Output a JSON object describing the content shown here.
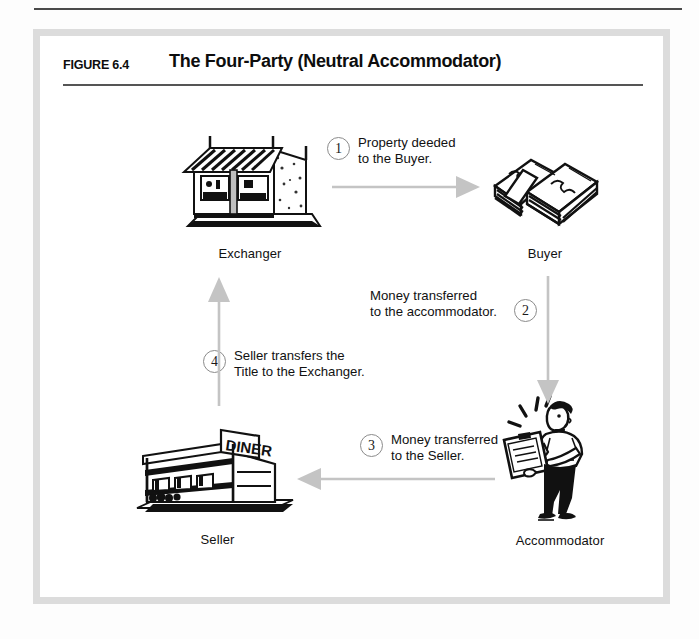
{
  "figure": {
    "number_label": "FIGURE 6.4",
    "title": "The Four-Party (Neutral Accommodator)"
  },
  "colors": {
    "arrow": "#c4c4c4",
    "frame": "#dcdcdc",
    "rule": "#555555",
    "ink": "#111111"
  },
  "diagram": {
    "type": "cycle-flow",
    "nodes": [
      {
        "id": "exchanger",
        "label": "Exchanger",
        "art": "storefront-building-icon"
      },
      {
        "id": "buyer",
        "label": "Buyer",
        "art": "cash-stack-icon"
      },
      {
        "id": "accommodator",
        "label": "Accommodator",
        "art": "person-with-clipboard-icon"
      },
      {
        "id": "seller",
        "label": "Seller",
        "art": "diner-building-icon"
      }
    ],
    "steps": [
      {
        "number": "1",
        "line1": "Property deeded",
        "line2": "to the Buyer.",
        "from": "exchanger",
        "to": "buyer",
        "direction": "right"
      },
      {
        "number": "2",
        "line1": "Money transferred",
        "line2": "to the accommodator.",
        "from": "buyer",
        "to": "accommodator",
        "direction": "down"
      },
      {
        "number": "3",
        "line1": "Money transferred",
        "line2": "to the Seller.",
        "from": "accommodator",
        "to": "seller",
        "direction": "left"
      },
      {
        "number": "4",
        "line1": "Seller  transfers the",
        "line2": "Title to the Exchanger.",
        "from": "seller",
        "to": "exchanger",
        "direction": "up"
      }
    ]
  }
}
